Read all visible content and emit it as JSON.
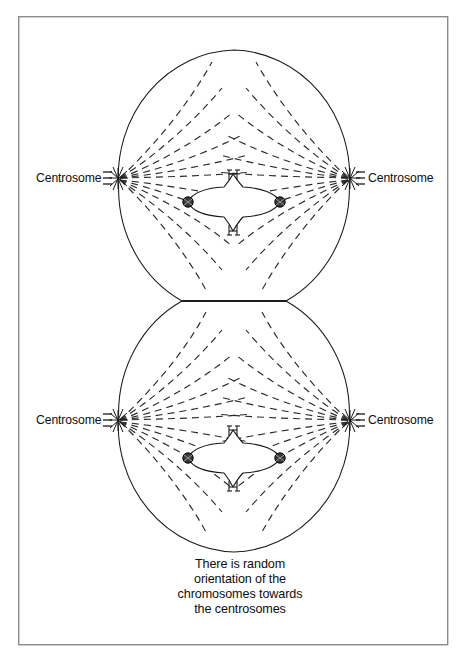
{
  "figure": {
    "title_alt": "Random orientation of chromosomes towards centrosomes",
    "background_color": "#ffffff",
    "frame": {
      "border_color": "#8a8a8a",
      "x": 18,
      "y": 16,
      "width": 430,
      "height": 629
    },
    "ink_color": "#1a1a1a",
    "fiber_color": "#2b2b2b",
    "kinetochore_color": "#3a3a3a"
  },
  "cells": [
    {
      "id": "upper-cell",
      "center_x": 234,
      "center_y": 177,
      "radius_x": 119,
      "radius_y": 127,
      "flat_edge_y": 301,
      "flat_edge_half_width": 52,
      "flat_edge_side": "bottom",
      "left_centrosome": {
        "label": "Centrosome",
        "x": 118,
        "y": 178,
        "label_x": 36,
        "label_y": 182,
        "tick_side": "left"
      },
      "right_centrosome": {
        "label": "Centrosome",
        "x": 350,
        "y": 178,
        "label_x": 362,
        "label_y": 182,
        "tick_side": "right"
      },
      "chromosome": {
        "center_x": 234,
        "center_y": 202,
        "half_width": 50,
        "half_height": 13,
        "arm_top_label": "chromatid-arm",
        "arm_bottom_label": "chromatid-arm",
        "kinetochore_left_x": 188,
        "kinetochore_right_x": 280,
        "kinetochore_radius": 5.2
      },
      "fiber_count_per_quadrant": 6
    },
    {
      "id": "lower-cell",
      "center_x": 234,
      "center_y": 425,
      "radius_x": 119,
      "radius_y": 127,
      "flat_edge_y": 301,
      "flat_edge_half_width": 52,
      "flat_edge_side": "top",
      "left_centrosome": {
        "label": "Centrosome",
        "x": 118,
        "y": 420,
        "label_x": 36,
        "label_y": 424,
        "tick_side": "left"
      },
      "right_centrosome": {
        "label": "Centrosome",
        "x": 350,
        "y": 420,
        "label_x": 362,
        "label_y": 424,
        "tick_side": "right"
      },
      "chromosome": {
        "center_x": 234,
        "center_y": 458,
        "half_width": 50,
        "half_height": 13,
        "arm_top_label": "chromatid-arm",
        "arm_bottom_label": "chromatid-arm",
        "kinetochore_left_x": 188,
        "kinetochore_right_x": 280,
        "kinetochore_radius": 5.2
      },
      "fiber_count_per_quadrant": 6
    }
  ],
  "caption": {
    "align": "center",
    "center_x": 240,
    "lines": [
      {
        "text": "There is random",
        "y": 568
      },
      {
        "text": "orientation of the",
        "y": 583
      },
      {
        "text": "chromosomes towards",
        "y": 598
      },
      {
        "text": "the centrosomes",
        "y": 613
      }
    ]
  }
}
